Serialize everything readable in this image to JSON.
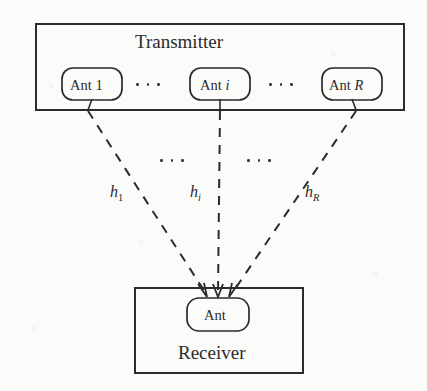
{
  "figure": {
    "kind": "block-diagram",
    "width": 427,
    "height": 391,
    "background_color": "#fbfbf9",
    "stroke_color": "#2b2b2b"
  },
  "transmitter": {
    "title": "Transmitter",
    "antennas": [
      {
        "label_prefix": "Ant",
        "label_index": "1",
        "index_italic": false
      },
      {
        "label_prefix": "Ant",
        "label_index": "i",
        "index_italic": true
      },
      {
        "label_prefix": "Ant",
        "label_index": "R",
        "index_italic": true
      }
    ],
    "ellipses": [
      "dots-left",
      "dots-right"
    ]
  },
  "receiver": {
    "title": "Receiver",
    "antenna": {
      "label": "Ant"
    }
  },
  "channels": [
    {
      "name": "h-sub-1",
      "symbol": "h",
      "subscript": "1",
      "subscript_italic": false
    },
    {
      "name": "h-sub-i",
      "symbol": "h",
      "subscript": "i",
      "subscript_italic": true
    },
    {
      "name": "h-sub-R",
      "symbol": "h",
      "subscript": "R",
      "subscript_italic": true
    }
  ],
  "mid_ellipses": [
    "dots-mid-left",
    "dots-mid-right"
  ]
}
